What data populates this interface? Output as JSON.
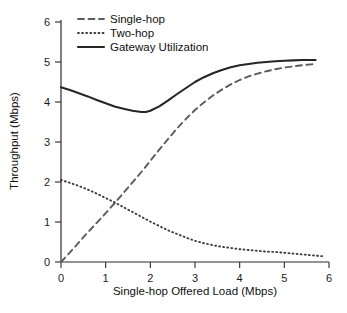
{
  "chart_data": {
    "type": "line",
    "title": "",
    "xlabel": "Single-hop Offered Load (Mbps)",
    "ylabel": "Throughput (Mbps)",
    "xlim": [
      0,
      6
    ],
    "ylim": [
      0,
      6
    ],
    "xticks": [
      0,
      1,
      2,
      3,
      4,
      5,
      6
    ],
    "yticks": [
      0,
      1,
      2,
      3,
      4,
      5,
      6
    ],
    "xtick_labels": [
      "0",
      "1",
      "2",
      "3",
      "4",
      "5",
      "6"
    ],
    "ytick_labels": [
      "0",
      "1",
      "2",
      "3",
      "4",
      "5",
      "6"
    ],
    "grid": false,
    "legend_position": "top-left-inside",
    "series": [
      {
        "name": "Single-hop",
        "style": "dashed",
        "color": "#5c5c5c",
        "x": [
          0.0,
          0.2,
          0.4,
          0.6,
          0.8,
          1.0,
          1.2,
          1.4,
          1.6,
          1.8,
          2.0,
          2.2,
          2.4,
          2.6,
          2.8,
          3.0,
          3.2,
          3.4,
          3.6,
          3.8,
          4.0,
          4.2,
          4.4,
          4.6,
          4.8,
          5.0,
          5.2,
          5.4,
          5.6,
          5.7
        ],
        "values": [
          0.0,
          0.24,
          0.49,
          0.74,
          0.98,
          1.22,
          1.47,
          1.73,
          1.99,
          2.25,
          2.53,
          2.81,
          3.08,
          3.34,
          3.58,
          3.8,
          3.99,
          4.16,
          4.31,
          4.44,
          4.55,
          4.64,
          4.71,
          4.77,
          4.82,
          4.86,
          4.89,
          4.92,
          4.94,
          4.95
        ]
      },
      {
        "name": "Two-hop",
        "style": "dotted",
        "color": "#3c3c3c",
        "x": [
          0.0,
          0.2,
          0.4,
          0.6,
          0.8,
          1.0,
          1.2,
          1.4,
          1.6,
          1.8,
          2.0,
          2.2,
          2.4,
          2.6,
          2.8,
          3.0,
          3.2,
          3.4,
          3.6,
          3.8,
          4.0,
          4.2,
          4.4,
          4.6,
          4.8,
          5.0,
          5.2,
          5.4,
          5.6,
          5.9
        ],
        "values": [
          2.05,
          1.98,
          1.9,
          1.81,
          1.71,
          1.6,
          1.49,
          1.37,
          1.25,
          1.13,
          1.01,
          0.9,
          0.79,
          0.7,
          0.61,
          0.53,
          0.47,
          0.42,
          0.38,
          0.35,
          0.32,
          0.3,
          0.28,
          0.26,
          0.25,
          0.23,
          0.21,
          0.19,
          0.17,
          0.14
        ]
      },
      {
        "name": "Gateway Utilization",
        "style": "solid",
        "color": "#262626",
        "x": [
          0.0,
          0.2,
          0.4,
          0.6,
          0.8,
          1.0,
          1.2,
          1.4,
          1.6,
          1.8,
          1.9,
          2.0,
          2.2,
          2.4,
          2.6,
          2.8,
          3.0,
          3.2,
          3.4,
          3.6,
          3.8,
          4.0,
          4.2,
          4.4,
          4.6,
          4.8,
          5.0,
          5.2,
          5.4,
          5.6,
          5.7
        ],
        "values": [
          4.37,
          4.3,
          4.22,
          4.14,
          4.05,
          3.97,
          3.89,
          3.83,
          3.78,
          3.75,
          3.75,
          3.78,
          3.89,
          4.04,
          4.2,
          4.35,
          4.5,
          4.62,
          4.72,
          4.8,
          4.87,
          4.92,
          4.95,
          4.98,
          5.0,
          5.02,
          5.03,
          5.04,
          5.05,
          5.05,
          5.05
        ]
      }
    ],
    "legend": [
      {
        "label": "Single-hop",
        "style": "dashed"
      },
      {
        "label": "Two-hop",
        "style": "dotted"
      },
      {
        "label": "Gateway Utilization",
        "style": "solid"
      }
    ]
  }
}
